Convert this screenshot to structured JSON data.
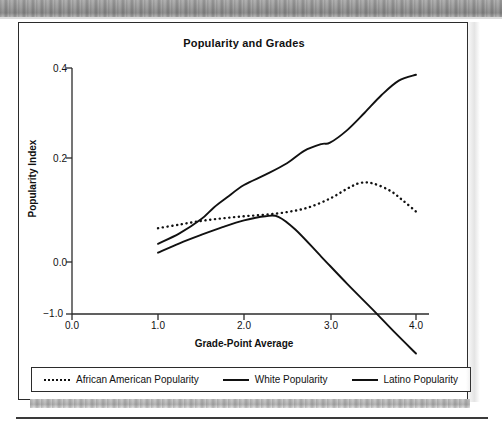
{
  "chart_data": {
    "type": "line",
    "title": "Popularity and Grades",
    "xlabel": "Grade-Point Average",
    "ylabel": "Popularity Index",
    "xticks": [
      "0.0",
      "1.0",
      "2.0",
      "3.0",
      "4.0"
    ],
    "xtick_values": [
      0.0,
      1.0,
      2.0,
      3.0,
      4.0
    ],
    "yticks": [
      "0.4",
      "0.2",
      "0.0",
      "−1.0"
    ],
    "ytick_values": [
      0.4,
      0.2,
      0.0,
      -1.0
    ],
    "xlim": [
      0.0,
      4.0
    ],
    "grid": false,
    "legend_position": "bottom",
    "series": [
      {
        "name": "African American Popularity",
        "style": "dotted",
        "color": "#111111",
        "x": [
          1.0,
          1.25,
          1.5,
          1.75,
          2.0,
          2.25,
          2.5,
          2.75,
          3.0,
          3.2,
          3.35,
          3.5,
          3.7,
          3.85,
          4.0
        ],
        "y": [
          0.065,
          0.072,
          0.079,
          0.084,
          0.088,
          0.091,
          0.096,
          0.105,
          0.122,
          0.141,
          0.152,
          0.151,
          0.137,
          0.118,
          0.097
        ]
      },
      {
        "name": "White Popularity",
        "style": "solid",
        "color": "#111111",
        "x": [
          1.0,
          1.25,
          1.5,
          1.65,
          1.8,
          2.0,
          2.25,
          2.5,
          2.7,
          2.9,
          3.0,
          3.2,
          3.4,
          3.6,
          3.8,
          4.0
        ],
        "y": [
          0.035,
          0.055,
          0.082,
          0.105,
          0.124,
          0.148,
          0.168,
          0.19,
          0.216,
          0.231,
          0.234,
          0.262,
          0.3,
          0.34,
          0.372,
          0.385
        ]
      },
      {
        "name": "Latino Popularity",
        "style": "solid",
        "color": "#111111",
        "x": [
          1.0,
          1.25,
          1.5,
          1.75,
          2.0,
          2.25,
          2.4,
          2.6,
          2.9,
          3.2,
          3.5,
          3.75,
          4.0
        ],
        "y": [
          0.018,
          0.036,
          0.052,
          0.067,
          0.08,
          0.088,
          0.087,
          0.062,
          0.01,
          -0.042,
          -0.092,
          -0.135,
          -0.176
        ]
      }
    ]
  },
  "legend": {
    "entries": [
      {
        "label": "African American Popularity",
        "style": "dotted"
      },
      {
        "label": "White Popularity",
        "style": "solid"
      },
      {
        "label": "Latino Popularity",
        "style": "solid"
      }
    ]
  }
}
